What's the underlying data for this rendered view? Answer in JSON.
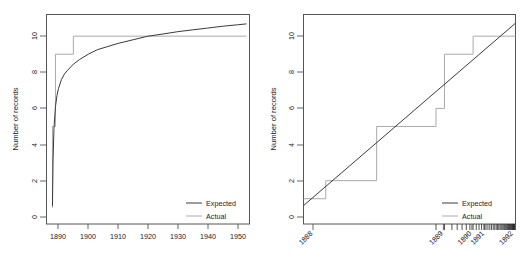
{
  "figure": {
    "background": "#ffffff",
    "expected_color": "#3a3a3a",
    "actual_color": "#aaaaaa",
    "axis_color": "#555555"
  },
  "chart_data": [
    {
      "type": "line",
      "panel": "left",
      "title": "",
      "xlabel": "",
      "ylabel": "Number of records",
      "xlim": [
        1886,
        1954
      ],
      "ylim": [
        -0.4,
        11.2
      ],
      "grid": false,
      "xticks": [
        1890,
        1900,
        1910,
        1920,
        1930,
        1940,
        1950
      ],
      "xticklabels": [
        "1890",
        "1900",
        "1910",
        "1920",
        "1930",
        "1940",
        "1950"
      ],
      "yticks": [
        0,
        2,
        4,
        6,
        8,
        10
      ],
      "yticklabels": [
        "0",
        "2",
        "4",
        "6",
        "8",
        "10"
      ],
      "legend": {
        "position": "bottom-right",
        "entries": [
          "Expected",
          "Actual"
        ]
      },
      "series": [
        {
          "name": "Expected",
          "style": "curve",
          "color": "#3a3a3a",
          "x": [
            1888.0,
            1888.2,
            1888.5,
            1889.0,
            1889.5,
            1890.0,
            1891.0,
            1892.0,
            1893.0,
            1895.0,
            1897.0,
            1900.0,
            1903.0,
            1906.0,
            1910.0,
            1915.0,
            1920.0,
            1925.0,
            1930.0,
            1935.0,
            1940.0,
            1945.0,
            1950.0,
            1953.0
          ],
          "y": [
            0.6,
            3.2,
            4.9,
            6.1,
            6.7,
            7.1,
            7.6,
            7.9,
            8.1,
            8.45,
            8.7,
            9.0,
            9.25,
            9.4,
            9.6,
            9.8,
            10.0,
            10.12,
            10.25,
            10.35,
            10.45,
            10.55,
            10.63,
            10.68
          ]
        },
        {
          "name": "Actual",
          "style": "step",
          "color": "#aaaaaa",
          "x": [
            1888.0,
            1888.0,
            1889.0,
            1889.0,
            1895.0,
            1895.0,
            1953.0
          ],
          "y": [
            0.5,
            5.0,
            5.0,
            9.0,
            9.0,
            10.0,
            10.0
          ]
        }
      ]
    },
    {
      "type": "line",
      "panel": "right",
      "title": "",
      "xlabel": "",
      "ylabel": "Number of records",
      "xlim": [
        0,
        1
      ],
      "ylim": [
        -0.4,
        11.2
      ],
      "grid": false,
      "xticks_transformed": [
        0.045,
        0.66,
        0.795,
        0.855,
        0.99
      ],
      "xticklabels": [
        "1888",
        "1889",
        "1890",
        "1891",
        "1892"
      ],
      "yticks": [
        0,
        2,
        4,
        6,
        8,
        10
      ],
      "yticklabels": [
        "0",
        "2",
        "4",
        "6",
        "8",
        "10"
      ],
      "rug_positions": [
        0.625,
        0.665,
        0.7,
        0.725,
        0.748,
        0.768,
        0.785,
        0.8,
        0.815,
        0.828,
        0.84,
        0.851,
        0.861,
        0.87,
        0.879,
        0.887,
        0.895,
        0.902,
        0.909,
        0.915,
        0.921,
        0.927,
        0.932,
        0.937,
        0.942,
        0.947,
        0.951,
        0.955,
        0.959,
        0.963,
        0.966,
        0.969,
        0.972,
        0.975,
        0.978,
        0.98,
        0.983,
        0.985,
        0.987,
        0.989,
        0.991,
        0.993,
        0.995,
        0.997,
        0.999
      ],
      "legend": {
        "position": "bottom-right",
        "entries": [
          "Expected",
          "Actual"
        ]
      },
      "series": [
        {
          "name": "Expected",
          "style": "straight-line",
          "color": "#3a3a3a",
          "x": [
            0.0,
            1.0
          ],
          "y": [
            0.62,
            10.72
          ]
        },
        {
          "name": "Actual",
          "style": "step",
          "color": "#aaaaaa",
          "x": [
            0.0,
            0.105,
            0.105,
            0.345,
            0.345,
            0.625,
            0.625,
            0.665,
            0.665,
            0.8,
            0.8,
            1.0
          ],
          "y": [
            1.0,
            1.0,
            2.0,
            2.0,
            5.0,
            5.0,
            6.0,
            6.0,
            9.0,
            9.0,
            10.0,
            10.0
          ]
        }
      ]
    }
  ]
}
